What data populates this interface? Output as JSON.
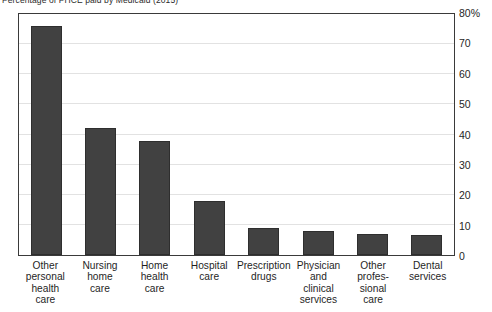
{
  "chart_data": {
    "type": "bar",
    "title": "Percentage of PHCE paid by Medicaid (2015)",
    "xlabel": "",
    "ylabel": "",
    "ylim": [
      0,
      80
    ],
    "grid": true,
    "legend": "none",
    "axis_position": "right",
    "categories": [
      "Other personal health care",
      "Nursing home care",
      "Home health care",
      "Hospital care",
      "Prescription drugs",
      "Physician and clinical services",
      "Other professional care",
      "Dental services"
    ],
    "category_lines": [
      [
        "Other",
        "personal",
        "health",
        "care"
      ],
      [
        "Nursing",
        "home",
        "care"
      ],
      [
        "Home",
        "health",
        "care"
      ],
      [
        "Hospital",
        "care"
      ],
      [
        "Prescription",
        "drugs"
      ],
      [
        "Physician",
        "and",
        "clinical",
        "services"
      ],
      [
        "Other",
        "profes-",
        "sional",
        "care"
      ],
      [
        "Dental",
        "services"
      ]
    ],
    "values": [
      76,
      42,
      38,
      18,
      9,
      8,
      7,
      6.5
    ],
    "ticks": [
      {
        "value": 80,
        "label": "80%"
      },
      {
        "value": 70,
        "label": "70"
      },
      {
        "value": 60,
        "label": "60"
      },
      {
        "value": 50,
        "label": "50"
      },
      {
        "value": 40,
        "label": "40"
      },
      {
        "value": 30,
        "label": "30"
      },
      {
        "value": 20,
        "label": "20"
      },
      {
        "value": 10,
        "label": "10"
      },
      {
        "value": 0,
        "label": "0"
      }
    ],
    "colors": {
      "bar": "#414141",
      "bar_border": "#2e2e2e",
      "frame": "#3a3a3a",
      "gridline": "#e2e2e2",
      "background": "#ffffff",
      "text": "#1f1f1f"
    }
  }
}
